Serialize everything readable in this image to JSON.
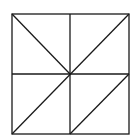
{
  "diagram": {
    "type": "square divided into triangles",
    "background": "#ffffff",
    "stroke_color": "#1a1a1a",
    "square": {
      "x1": 12,
      "y1": 14,
      "x2": 129,
      "y2": 134
    },
    "center": {
      "x": 70,
      "y": 74
    },
    "lines": [
      {
        "name": "vertical-midline",
        "x1": 70,
        "y1": 14,
        "x2": 70,
        "y2": 134
      },
      {
        "name": "horizontal-midline",
        "x1": 12,
        "y1": 74,
        "x2": 129,
        "y2": 74
      },
      {
        "name": "diagonal-top-left-to-center",
        "x1": 12,
        "y1": 14,
        "x2": 70,
        "y2": 74
      },
      {
        "name": "diagonal-top-right-to-bottom-left",
        "x1": 129,
        "y1": 14,
        "x2": 12,
        "y2": 134
      },
      {
        "name": "diagonal-bottom-right-quadrant",
        "x1": 129,
        "y1": 74,
        "x2": 70,
        "y2": 134
      }
    ]
  }
}
